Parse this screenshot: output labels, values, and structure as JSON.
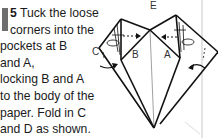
{
  "instruction": {
    "step_number": "5",
    "lines": [
      " Tuck the loose",
      "corners into the",
      "pockets at B",
      "and A,",
      "locking B and A",
      "to the body of the",
      "paper. Fold in C",
      "and D as shown."
    ]
  },
  "diagram": {
    "labels": {
      "top": "E",
      "left_pocket": "B",
      "right_pocket": "A",
      "left_corner": "C"
    },
    "colors": {
      "line": "#111111",
      "step_bar": "#6e6e6e"
    }
  }
}
